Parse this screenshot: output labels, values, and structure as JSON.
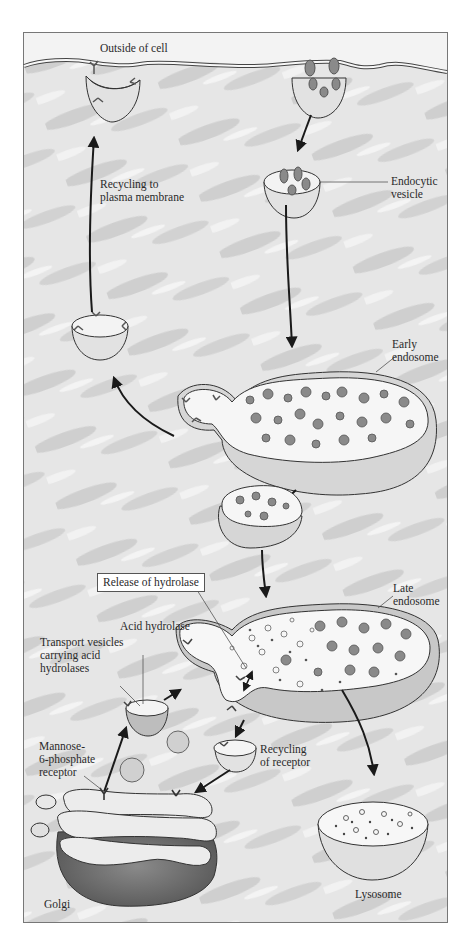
{
  "figure": {
    "frame": {
      "stroke": "#777777",
      "background": "#dcdcdc"
    },
    "colors": {
      "cytoplasm_light": "#eeeeee",
      "cytoplasm_mid": "#c9c9c9",
      "membrane": "#f7f7f7",
      "vesicle_fill": "#e2e2e2",
      "cargo": "#8a8a8a",
      "golgi_dark": "#6a6a6a",
      "arrow": "#1a1a1a"
    },
    "labels": {
      "outside_of_cell": "Outside of cell",
      "recycling_to_plasma_membrane": "Recycling to\nplasma membrane",
      "endocytic_vesicle": "Endocytic\nvesicle",
      "early_endosome": "Early\nendosome",
      "release_of_hydrolase": "Release of hydrolase",
      "late_endosome": "Late\nendosome",
      "acid_hydrolase": "Acid hydrolase",
      "transport_vesicles": "Transport vesicles\ncarrying acid\nhydrolases",
      "mannose_6_phosphate_receptor": "Mannose-\n6-phosphate\nreceptor",
      "recycling_of_receptor": "Recycling\nof receptor",
      "lysosome": "Lysosome",
      "golgi": "Golgi"
    }
  }
}
